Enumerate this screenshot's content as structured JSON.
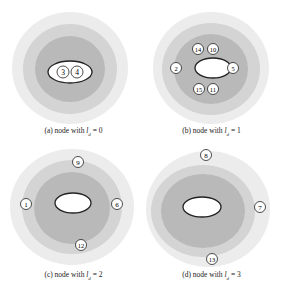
{
  "colors": {
    "outer_ring": "#ececec",
    "middle_ring": "#d4d4d4",
    "inner_ring": "#b9b9b9",
    "core": "#ffffff",
    "node_fill": "#ffffff",
    "stroke": "#222222"
  },
  "panels": [
    {
      "id": "a",
      "caption_prefix": "(a) node with ",
      "caption_var": "l",
      "caption_sub": "d",
      "caption_suffix": " = 0",
      "nodes": [
        {
          "label": "3"
        },
        {
          "label": "4"
        }
      ]
    },
    {
      "id": "b",
      "caption_prefix": "(b) node with ",
      "caption_var": "l",
      "caption_sub": "d",
      "caption_suffix": " = 1",
      "nodes": [
        {
          "label": "14"
        },
        {
          "label": "10"
        },
        {
          "label": "2"
        },
        {
          "label": "5"
        },
        {
          "label": "15"
        },
        {
          "label": "11"
        }
      ]
    },
    {
      "id": "c",
      "caption_prefix": "(c) node with ",
      "caption_var": "l",
      "caption_sub": "d",
      "caption_suffix": " = 2",
      "nodes": [
        {
          "label": "9"
        },
        {
          "label": "1"
        },
        {
          "label": "6"
        },
        {
          "label": "12"
        }
      ]
    },
    {
      "id": "d",
      "caption_prefix": "(d) node with ",
      "caption_var": "l",
      "caption_sub": "d",
      "caption_suffix": " = 3",
      "nodes": [
        {
          "label": "8"
        },
        {
          "label": "7"
        },
        {
          "label": "13"
        }
      ]
    }
  ]
}
